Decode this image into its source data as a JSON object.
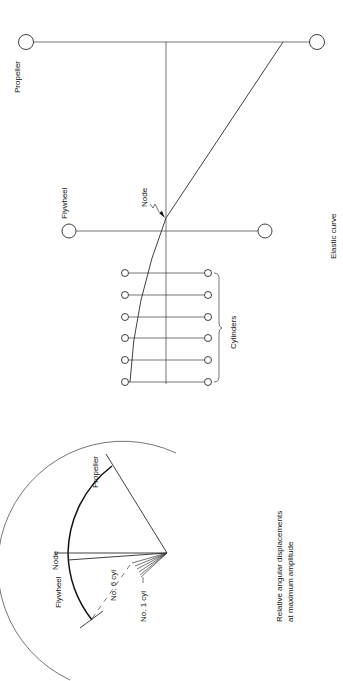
{
  "elastic_curve_diagram": {
    "caption": "Elastic curve",
    "labels": {
      "propeller": "Propeller",
      "flywheel": "Flywheel",
      "node": "Node",
      "cylinders": "Cylinders"
    },
    "masses": [
      "Propeller",
      "Flywheel",
      "Cyl 6",
      "Cyl 5",
      "Cyl 4",
      "Cyl 3",
      "Cyl 2",
      "Cyl 1"
    ]
  },
  "displacement_diagram": {
    "caption_line1": "Relative angular displacements",
    "caption_line2": "at maximum amplitude",
    "labels": {
      "propeller": "Propeller",
      "node": "Node",
      "flywheel": "Flywheel",
      "cyl6": "No. 6 cyl",
      "cyl1": "No. 1 cyl"
    }
  },
  "colors": {
    "line": "#2a2a2a",
    "background": "#ffffff"
  }
}
